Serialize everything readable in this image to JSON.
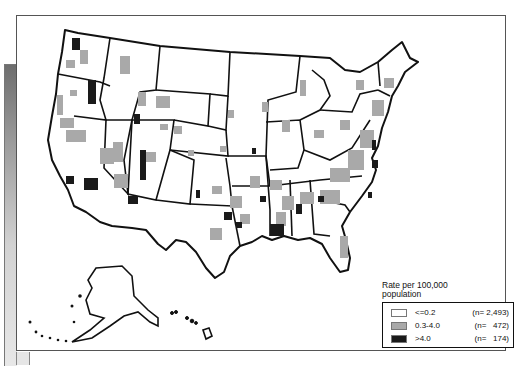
{
  "map": {
    "type": "choropleth",
    "region": "United States (counties), including Alaska and Hawaii insets",
    "colors": {
      "low": "#ffffff",
      "mid": "#a9a9a9",
      "high": "#1a1a1a",
      "state_border": "#111111"
    }
  },
  "legend": {
    "title_line1": "Rate per 100,000",
    "title_line2": "population",
    "items": [
      {
        "label": "<=0.2",
        "count": "(n= 2,493)",
        "color": "#ffffff"
      },
      {
        "label": "0.3-4.0",
        "count": "(n=   472)",
        "color": "#a9a9a9"
      },
      {
        "label": ">4.0",
        "count": "(n=   174)",
        "color": "#1a1a1a"
      }
    ]
  }
}
